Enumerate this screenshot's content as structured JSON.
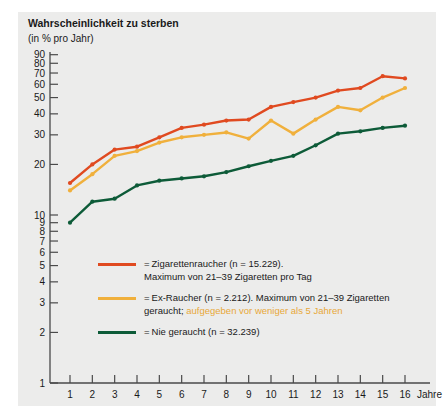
{
  "figure": {
    "title": "Wahrscheinlichkeit zu sterben",
    "subtitle": "(in % pro Jahr)",
    "background": "#ececeb"
  },
  "axes": {
    "x_unit_label": "Jahre",
    "x_ticks": [
      "1",
      "2",
      "3",
      "4",
      "5",
      "6",
      "7",
      "8",
      "9",
      "10",
      "11",
      "12",
      "13",
      "14",
      "15",
      "16"
    ],
    "y_ticks": [
      "90",
      "80",
      "70",
      "60",
      "50",
      "40",
      "30",
      "20",
      "10",
      "9",
      "8",
      "7",
      "6",
      "5",
      "4",
      "3",
      "2",
      "1"
    ]
  },
  "legend": {
    "items": [
      {
        "name": "zigarettenraucher",
        "color": "#e04a20",
        "eq": "=",
        "line1": "Zigarettenraucher (n = 15.229).",
        "line2": "Maximum von 21–39 Zigaretten pro Tag",
        "line2_highlight": "",
        "line2_tail": ""
      },
      {
        "name": "ex-raucher",
        "color": "#f0b03c",
        "eq": "=",
        "line1": "Ex-Raucher (n = 2.212). Maximum von 21–39 Zigaretten",
        "line2": "geraucht; ",
        "line2_highlight": "aufgegeben vor weniger als 5 Jahren",
        "line2_tail": ""
      },
      {
        "name": "nie-geraucht",
        "color": "#0d5b38",
        "eq": "=",
        "line1": "Nie geraucht (n = 32.239)",
        "line2": "",
        "line2_highlight": "",
        "line2_tail": ""
      }
    ]
  },
  "chart_data": {
    "type": "line",
    "title": "Wahrscheinlichkeit zu sterben",
    "subtitle": "(in % pro Jahr)",
    "xlabel": "Jahre",
    "ylabel": "Wahrscheinlichkeit zu sterben (in % pro Jahr)",
    "yscale": "log",
    "ylim": [
      1,
      90
    ],
    "xlim": [
      1,
      16
    ],
    "grid": false,
    "legend_position": "inside-lower-left",
    "x": [
      1,
      2,
      3,
      4,
      5,
      6,
      7,
      8,
      9,
      10,
      11,
      12,
      13,
      14,
      15,
      16
    ],
    "series": [
      {
        "name": "Zigarettenraucher (n = 15.229). Maximum von 21–39 Zigaretten pro Tag",
        "short_name": "Zigarettenraucher",
        "color": "#e04a20",
        "values": [
          15.5,
          20.0,
          24.5,
          25.5,
          29.0,
          33.0,
          34.5,
          36.5,
          37.0,
          44.0,
          47.0,
          50.0,
          55.0,
          57.0,
          67.0,
          65.0
        ]
      },
      {
        "name": "Ex-Raucher (n = 2.212). Maximum von 21–39 Zigaretten geraucht; aufgegeben vor weniger als 5 Jahren",
        "short_name": "Ex-Raucher",
        "color": "#f0b03c",
        "values": [
          14.0,
          17.5,
          22.5,
          24.0,
          27.0,
          29.0,
          30.0,
          31.0,
          28.5,
          36.5,
          30.5,
          37.0,
          44.0,
          42.0,
          50.0,
          57.0
        ]
      },
      {
        "name": "Nie geraucht (n = 32.239)",
        "short_name": "Nie geraucht",
        "color": "#0d5b38",
        "values": [
          9.0,
          12.0,
          12.5,
          15.0,
          16.0,
          16.5,
          17.0,
          18.0,
          19.5,
          21.0,
          22.5,
          26.0,
          30.5,
          31.5,
          33.0,
          34.0
        ]
      }
    ]
  }
}
